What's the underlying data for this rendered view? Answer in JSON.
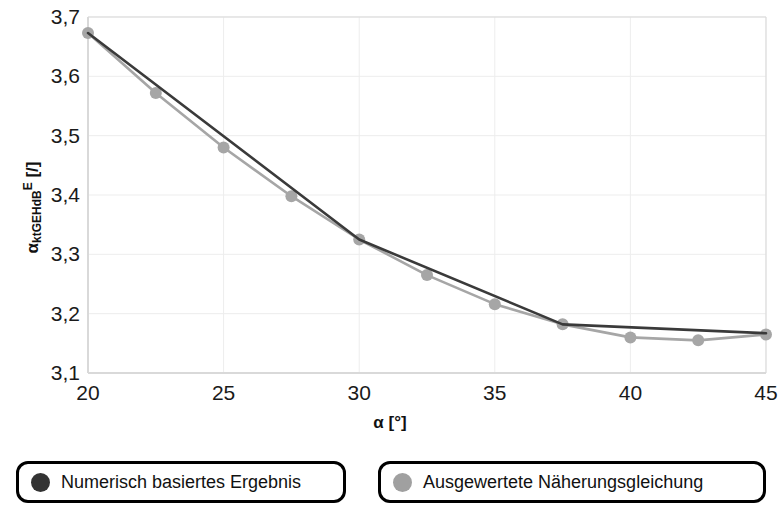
{
  "chart_data": {
    "type": "line",
    "title": "",
    "xlabel": "α [°]",
    "ylabel": "α_ktGEHdB^E [/]",
    "ylabel_parts": {
      "base": "α",
      "sub": "ktGEHdB",
      "sup": "E",
      "unit": " [/]"
    },
    "xlim": [
      20,
      45
    ],
    "ylim": [
      3.1,
      3.7
    ],
    "xticks": [
      20,
      25,
      30,
      35,
      40,
      45
    ],
    "xtick_labels": [
      "20",
      "25",
      "30",
      "35",
      "40",
      "45"
    ],
    "yticks": [
      3.1,
      3.2,
      3.3,
      3.4,
      3.5,
      3.6,
      3.7
    ],
    "ytick_labels": [
      "3,1",
      "3,2",
      "3,3",
      "3,4",
      "3,5",
      "3,6",
      "3,7"
    ],
    "grid": true,
    "legend_position": "below",
    "series": [
      {
        "name": "Numerisch basiertes Ergebnis",
        "color": "#3a3a3a",
        "marker": "none",
        "x": [
          20,
          30,
          37.5,
          45
        ],
        "values": [
          3.673,
          3.325,
          3.182,
          3.167
        ]
      },
      {
        "name": "Ausgewertete Näherungsgleichung",
        "color": "#a6a6a6",
        "marker": "circle",
        "x": [
          20,
          22.5,
          25,
          27.5,
          30,
          32.5,
          35,
          37.5,
          40,
          42.5,
          45
        ],
        "values": [
          3.673,
          3.572,
          3.48,
          3.398,
          3.325,
          3.265,
          3.216,
          3.182,
          3.16,
          3.155,
          3.165
        ]
      }
    ]
  },
  "axes": {
    "x_title": "α [°]",
    "y_title_base": "α",
    "y_title_sub": "ktGEHdB",
    "y_title_sup": "E",
    "y_title_unit": " [/]"
  },
  "legend": {
    "items": [
      {
        "label": "Numerisch basiertes Ergebnis",
        "color": "#333333"
      },
      {
        "label": "Ausgewertete Näherungsgleichung",
        "color": "#a0a0a0"
      }
    ]
  },
  "colors": {
    "dark_series": "#3a3a3a",
    "light_series": "#a6a6a6",
    "grid": "#ededed",
    "axis": "#d9d9d9",
    "text": "#111111"
  }
}
